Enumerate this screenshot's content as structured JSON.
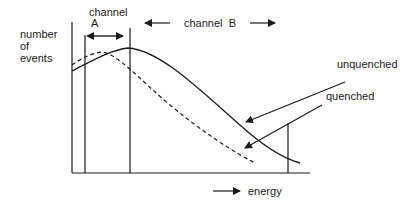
{
  "diagram": {
    "y_axis_label": [
      "number",
      "of",
      "events"
    ],
    "x_axis_label": "energy",
    "channel_a": {
      "line1": "channel",
      "line2": "A"
    },
    "channel_b": {
      "label": "channel  B"
    },
    "curves": [
      {
        "name": "unquenched",
        "style": "solid",
        "label": "unquenched"
      },
      {
        "name": "quenched",
        "style": "dashed",
        "label": "quenched"
      }
    ],
    "colors": {
      "ink": "#1a1a1a",
      "background": "#ffffff"
    }
  }
}
